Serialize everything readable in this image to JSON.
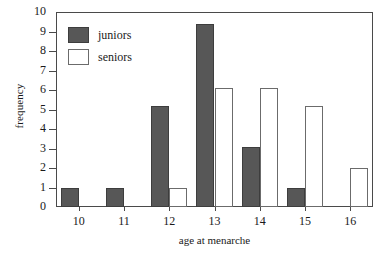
{
  "chart_data": {
    "type": "bar",
    "title": "",
    "xlabel": "age at menarche",
    "ylabel": "frequency",
    "categories": [
      "10",
      "11",
      "12",
      "13",
      "14",
      "15",
      "16"
    ],
    "xlim": [
      9.5,
      16.5
    ],
    "ylim": [
      0,
      10
    ],
    "ytick_labels": [
      "0",
      "1",
      "2",
      "3",
      "4",
      "5",
      "6",
      "7",
      "8",
      "9",
      "10"
    ],
    "ytick_values": [
      0,
      1,
      2,
      3,
      4,
      5,
      6,
      7,
      8,
      9,
      10
    ],
    "grid": false,
    "legend_position": "upper-left",
    "series": [
      {
        "name": "juniors",
        "color": "#575757",
        "values": [
          1,
          1,
          5.2,
          9.4,
          3.1,
          1,
          0
        ]
      },
      {
        "name": "seniors",
        "color": "#ffffff",
        "values": [
          0,
          0,
          1,
          6.1,
          6.1,
          5.2,
          2
        ]
      }
    ]
  },
  "legend": {
    "items": [
      {
        "label": "juniors",
        "swatch": "filled-dark-square"
      },
      {
        "label": "seniors",
        "swatch": "outlined-white-square"
      }
    ]
  },
  "axes": {
    "y_title": "frequency",
    "x_title": "age at menarche"
  }
}
